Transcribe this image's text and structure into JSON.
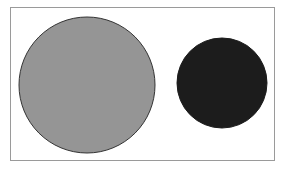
{
  "diagram": {
    "frame": {
      "border_color": "#9a9a9a",
      "background": "#ffffff"
    },
    "shapes": [
      {
        "type": "circle",
        "name": "large-gray-circle",
        "cx": 87,
        "cy": 85,
        "r": 68,
        "fill": "#959595",
        "stroke": "#333333"
      },
      {
        "type": "circle",
        "name": "small-dark-circle",
        "cx": 222,
        "cy": 83,
        "r": 45,
        "fill": "#1c1c1c",
        "stroke": "#1c1c1c"
      }
    ]
  }
}
